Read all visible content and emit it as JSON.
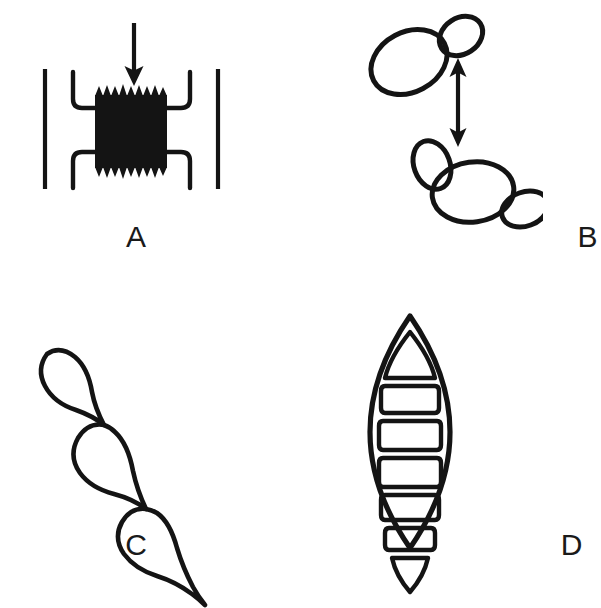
{
  "figure": {
    "background_color": "#ffffff",
    "ink_color": "#141414",
    "panel_count": 4,
    "layout": "2x2 grid"
  },
  "panels": [
    {
      "id": "A",
      "label": "A",
      "subject": "dark serrated sporangium-like body held between two hooked bracket lines, with a downward pointing arrow above",
      "elements": [
        {
          "name": "down-arrow",
          "kind": "arrow",
          "direction": "down"
        },
        {
          "name": "left-outer-line",
          "kind": "vertical-line"
        },
        {
          "name": "left-bracket",
          "kind": "hooked-bracket",
          "side": "left"
        },
        {
          "name": "dark-body",
          "kind": "filled-serrated-block"
        },
        {
          "name": "right-bracket",
          "kind": "hooked-bracket",
          "side": "right"
        },
        {
          "name": "right-outer-line",
          "kind": "vertical-line"
        }
      ]
    },
    {
      "id": "B",
      "label": "B",
      "subject": "two budding yeast cell clusters separated by a vertical double-headed arrow",
      "elements": [
        {
          "name": "upper-mother-cell",
          "kind": "ellipse"
        },
        {
          "name": "upper-bud",
          "kind": "ellipse"
        },
        {
          "name": "double-headed-arrow",
          "kind": "arrow",
          "direction": "up-down"
        },
        {
          "name": "lower-upper-bud",
          "kind": "ellipse"
        },
        {
          "name": "lower-mother-cell",
          "kind": "ellipse"
        },
        {
          "name": "lower-right-bud",
          "kind": "ellipse"
        }
      ]
    },
    {
      "id": "C",
      "label": "C",
      "subject": "chain of three teardrop shaped pseudohyphal cells running from upper left to lower right, tapering to a point",
      "elements": [
        {
          "name": "cell-1",
          "kind": "teardrop"
        },
        {
          "name": "cell-2",
          "kind": "teardrop"
        },
        {
          "name": "cell-3",
          "kind": "teardrop"
        },
        {
          "name": "terminal-tip",
          "kind": "taper"
        }
      ]
    },
    {
      "id": "D",
      "label": "D",
      "subject": "fusiform septate macroconidium with seven internal compartments",
      "compartment_count": 7,
      "elements": [
        {
          "name": "outer-wall",
          "kind": "spindle-outline"
        },
        {
          "name": "compartments",
          "kind": "septate-cells",
          "count": 7
        }
      ]
    }
  ]
}
